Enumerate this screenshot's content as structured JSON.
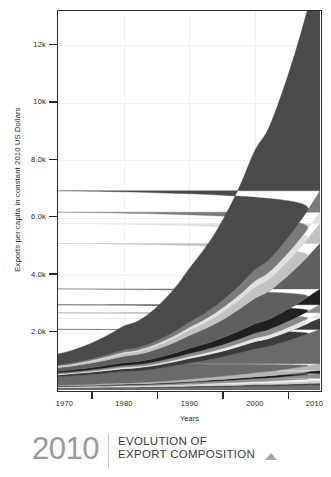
{
  "caption": {
    "year": "2010",
    "line1": "EVOLUTION OF",
    "line2": "EXPORT COMPOSITION",
    "triangle_icon": "triangle-up-icon"
  },
  "chart_data": {
    "type": "area",
    "title": "",
    "subtitle": "",
    "xlabel": "Years",
    "ylabel": "Exports per capita in constant 2010 US Dollars",
    "xlim": [
      1970,
      2010
    ],
    "ylim": [
      0,
      13200
    ],
    "grid": true,
    "legend": "none",
    "x_ticks": [
      1970,
      1980,
      1990,
      2000,
      2010
    ],
    "x_tick_labels": [
      "1970",
      "1980",
      "1990",
      "2000",
      "2010"
    ],
    "x_minor_ticks": [
      1975,
      1985,
      1995,
      2005
    ],
    "y_ticks": [
      2000,
      4000,
      6000,
      8000,
      10000,
      12000
    ],
    "y_tick_labels": [
      "2.0k",
      "4.0k",
      "6.0k",
      "8.0k",
      "10k",
      "12k"
    ],
    "x": [
      1970,
      1972,
      1974,
      1976,
      1978,
      1980,
      1982,
      1984,
      1986,
      1988,
      1990,
      1992,
      1994,
      1996,
      1998,
      2000,
      2002,
      2004,
      2006,
      2008,
      2010
    ],
    "series": [
      {
        "name": "band-01",
        "color": "#6e6e6e",
        "values": [
          60,
          62,
          66,
          70,
          74,
          78,
          80,
          84,
          90,
          96,
          104,
          110,
          118,
          126,
          134,
          142,
          148,
          156,
          166,
          176,
          186
        ]
      },
      {
        "name": "band-02",
        "color": "#2b2b2b",
        "values": [
          14,
          15,
          16,
          17,
          18,
          19,
          20,
          21,
          23,
          25,
          27,
          29,
          31,
          33,
          35,
          37,
          39,
          42,
          45,
          48,
          52
        ]
      },
      {
        "name": "band-03",
        "color": "#cfcfcf",
        "values": [
          18,
          19,
          21,
          23,
          25,
          27,
          28,
          30,
          33,
          36,
          40,
          44,
          48,
          52,
          57,
          62,
          66,
          72,
          78,
          85,
          92
        ]
      },
      {
        "name": "band-04",
        "color": "#f2f2f2",
        "values": [
          10,
          11,
          12,
          13,
          15,
          16,
          17,
          19,
          21,
          24,
          27,
          30,
          34,
          38,
          43,
          48,
          52,
          58,
          64,
          71,
          78
        ]
      },
      {
        "name": "band-05",
        "color": "#8f8f8f",
        "values": [
          22,
          24,
          27,
          30,
          34,
          38,
          40,
          44,
          50,
          56,
          64,
          71,
          79,
          88,
          98,
          108,
          116,
          128,
          141,
          155,
          170
        ]
      },
      {
        "name": "band-06",
        "color": "#1a1a1a",
        "values": [
          12,
          13,
          14,
          16,
          18,
          20,
          21,
          23,
          26,
          30,
          34,
          38,
          43,
          48,
          54,
          60,
          65,
          72,
          80,
          88,
          97
        ]
      },
      {
        "name": "band-07",
        "color": "#b5b5b5",
        "values": [
          26,
          29,
          33,
          37,
          42,
          47,
          50,
          56,
          63,
          72,
          82,
          92,
          103,
          116,
          130,
          145,
          157,
          174,
          193,
          214,
          236
        ]
      },
      {
        "name": "band-08",
        "color": "#6a6a6a",
        "values": [
          300,
          312,
          330,
          350,
          372,
          396,
          408,
          432,
          470,
          510,
          560,
          600,
          645,
          700,
          760,
          828,
          870,
          940,
          1020,
          1110,
          1200
        ]
      },
      {
        "name": "band-09",
        "color": "#3a3a3a",
        "values": [
          70,
          74,
          80,
          86,
          94,
          102,
          106,
          114,
          126,
          140,
          156,
          170,
          186,
          205,
          226,
          250,
          265,
          290,
          318,
          350,
          385
        ]
      },
      {
        "name": "band-10",
        "color": "#e6e6e6",
        "values": [
          30,
          32,
          35,
          38,
          42,
          46,
          48,
          52,
          58,
          65,
          73,
          80,
          88,
          98,
          109,
          121,
          129,
          142,
          157,
          173,
          191
        ]
      },
      {
        "name": "band-11",
        "color": "#8a8a8a",
        "values": [
          40,
          43,
          47,
          52,
          58,
          64,
          67,
          73,
          82,
          92,
          104,
          115,
          127,
          142,
          158,
          176,
          188,
          208,
          230,
          254,
          281
        ]
      },
      {
        "name": "band-12",
        "color": "#202020",
        "values": [
          55,
          60,
          67,
          75,
          85,
          96,
          102,
          114,
          130,
          150,
          174,
          195,
          220,
          250,
          284,
          322,
          348,
          390,
          438,
          492,
          552
        ]
      },
      {
        "name": "band-13",
        "color": "#5f5f5f",
        "values": [
          120,
          132,
          150,
          172,
          198,
          228,
          246,
          280,
          326,
          382,
          450,
          512,
          586,
          674,
          776,
          892,
          970,
          1094,
          1238,
          1400,
          1582
        ]
      },
      {
        "name": "band-14",
        "color": "#c2c2c2",
        "values": [
          45,
          50,
          58,
          67,
          78,
          91,
          98,
          112,
          132,
          156,
          186,
          214,
          246,
          286,
          332,
          385,
          420,
          476,
          542,
          616,
          700
        ]
      },
      {
        "name": "band-15",
        "color": "#e0e0e0",
        "values": [
          20,
          23,
          27,
          32,
          38,
          45,
          49,
          57,
          68,
          81,
          98,
          114,
          132,
          154,
          180,
          210,
          230,
          262,
          300,
          343,
          392
        ]
      },
      {
        "name": "band-16",
        "color": "#7a7a7a",
        "values": [
          35,
          40,
          47,
          56,
          67,
          80,
          88,
          102,
          122,
          147,
          178,
          208,
          242,
          284,
          334,
          392,
          430,
          492,
          566,
          650,
          746
        ]
      },
      {
        "name": "band-17",
        "color": "#4a4a4a",
        "values": [
          380,
          430,
          500,
          590,
          700,
          830,
          910,
          1060,
          1270,
          1530,
          1860,
          2180,
          2540,
          2990,
          3520,
          4140,
          4550,
          5220,
          6020,
          6950,
          8010
        ]
      }
    ]
  }
}
